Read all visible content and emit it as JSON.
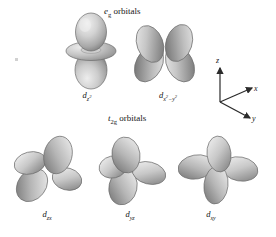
{
  "figure": {
    "background_color": "#ffffff",
    "render_style": "grayscale shaded 3D lobes"
  },
  "headings": [
    {
      "id": "eg",
      "symbol": "e",
      "subscript": "g",
      "text": " orbitals",
      "full": "eg orbitals"
    },
    {
      "id": "t2g",
      "symbol": "t",
      "subscript": "2g",
      "text": " orbitals",
      "full": "t2g orbitals"
    }
  ],
  "orbitals": {
    "eg": [
      {
        "id": "dz2",
        "label_d": "d",
        "label_sub": "z",
        "label_sup": "2",
        "label_full": "dz2",
        "lobes": 2,
        "has_torus": true,
        "orientation": "vertical along z with equatorial ring"
      },
      {
        "id": "dx2y2",
        "label_d": "d",
        "label_sub": "x",
        "label_sup": "2",
        "label_sub2": "−y",
        "label_sup2": "2",
        "label_full": "dx2-y2",
        "lobes": 4,
        "has_torus": false,
        "orientation": "four lobes along x and y axes"
      }
    ],
    "t2g": [
      {
        "id": "dzx",
        "label_d": "d",
        "label_sub": "zx",
        "label_full": "dzx",
        "lobes": 4,
        "has_torus": false,
        "orientation": "four lobes between z and x axes"
      },
      {
        "id": "dyz",
        "label_d": "d",
        "label_sub": "yz",
        "label_full": "dyz",
        "lobes": 4,
        "has_torus": false,
        "orientation": "four lobes between y and z axes"
      },
      {
        "id": "dxy",
        "label_d": "d",
        "label_sub": "xy",
        "label_full": "dxy",
        "lobes": 4,
        "has_torus": false,
        "orientation": "four lobes between x and y axes"
      }
    ]
  },
  "axis_triad": {
    "axes": [
      {
        "name": "z",
        "label": "z",
        "direction": "up"
      },
      {
        "name": "x",
        "label": "x",
        "direction": "upper-right"
      },
      {
        "name": "y",
        "label": "y",
        "direction": "lower-right"
      }
    ]
  },
  "colors": {
    "lobe_light": "#e2e2e2",
    "lobe_mid": "#b5b5b5",
    "lobe_dark": "#787878",
    "outline": "#5a5a5a",
    "text": "#151515",
    "background": "#ffffff",
    "axis_line": "#2b2b2b"
  }
}
